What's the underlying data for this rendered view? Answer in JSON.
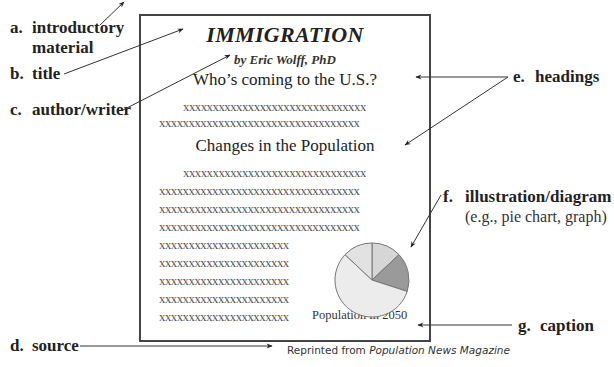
{
  "labels": {
    "a": {
      "letter": "a.",
      "text": "introductory",
      "text2": "material"
    },
    "b": {
      "letter": "b.",
      "text": "title"
    },
    "c": {
      "letter": "c.",
      "text": "author/writer"
    },
    "d": {
      "letter": "d.",
      "text": "source"
    },
    "e": {
      "letter": "e.",
      "text": "headings"
    },
    "f": {
      "letter": "f.",
      "text": "illustration/diagram",
      "text2": "(e.g., pie chart, graph)"
    },
    "g": {
      "letter": "g.",
      "text": "caption"
    }
  },
  "document": {
    "title": "IMMIGRATION",
    "author": "by Eric Wolff, PhD",
    "heading1": "Who’s coming to the U.S.?",
    "heading2": "Changes in the Population",
    "lines": {
      "indented": "xxxxxxxxxxxxxxxxxxxxxxxxxxxxxxx",
      "full": "xxxxxxxxxxxxxxxxxxxxxxxxxxxxxxxxxx",
      "short": "xxxxxxxxxxxxxxxxxxxxxx"
    },
    "caption": "Population in 2050",
    "source_prefix": "Reprinted from ",
    "source_pub": "Population News Magazine"
  },
  "chart_data": {
    "type": "pie",
    "title": "Population in 2050",
    "categories": [
      "slice-1",
      "slice-2",
      "slice-3",
      "slice-4"
    ],
    "values": [
      13,
      17,
      57,
      13
    ],
    "colors": [
      "#d6d6d6",
      "#9a9a9a",
      "#ececec",
      "#e2e2e2"
    ]
  },
  "colors": {
    "border": "#444444",
    "text": "#222222",
    "arrow": "#333333"
  }
}
